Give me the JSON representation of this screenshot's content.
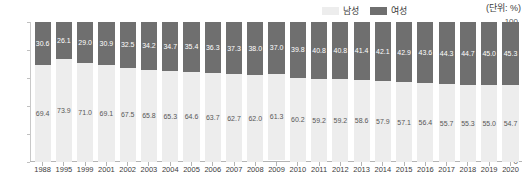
{
  "legend": {
    "items": [
      {
        "label": "남성",
        "color": "#ededed",
        "key": "male"
      },
      {
        "label": "여성",
        "color": "#6f6f6f",
        "key": "female"
      }
    ],
    "unit_note": "(단위: %)"
  },
  "chart_data": {
    "type": "bar",
    "stacked": true,
    "title": "",
    "subtitle": "",
    "xlabel": "",
    "ylabel": "",
    "ylim": [
      0,
      100
    ],
    "yticks": [
      0,
      20,
      40,
      60,
      80,
      100
    ],
    "ytick_labels": [
      "0",
      "20",
      "40",
      "60",
      "80",
      "100"
    ],
    "grid": false,
    "legend_position": "top-right",
    "unit": "%",
    "categories": [
      "1988",
      "1995",
      "1999",
      "2001",
      "2002",
      "2003",
      "2004",
      "2005",
      "2006",
      "2007",
      "2008",
      "2009",
      "2010",
      "2011",
      "2012",
      "2013",
      "2014",
      "2015",
      "2016",
      "2017",
      "2018",
      "2019",
      "2020"
    ],
    "series": [
      {
        "name": "여성",
        "color": "#6f6f6f",
        "values": [
          30.6,
          26.1,
          29.0,
          30.9,
          32.5,
          34.2,
          34.7,
          35.4,
          36.3,
          37.3,
          38.0,
          37.0,
          39.8,
          40.8,
          40.8,
          41.4,
          42.1,
          42.9,
          43.6,
          44.3,
          44.7,
          45.0,
          45.3
        ]
      },
      {
        "name": "남성",
        "color": "#ededed",
        "values": [
          69.4,
          73.9,
          71.0,
          69.1,
          67.5,
          65.8,
          65.3,
          64.6,
          63.7,
          62.7,
          62.0,
          61.3,
          60.2,
          59.2,
          59.2,
          58.6,
          57.9,
          57.1,
          56.4,
          55.7,
          55.3,
          55.0,
          54.7
        ]
      }
    ]
  }
}
